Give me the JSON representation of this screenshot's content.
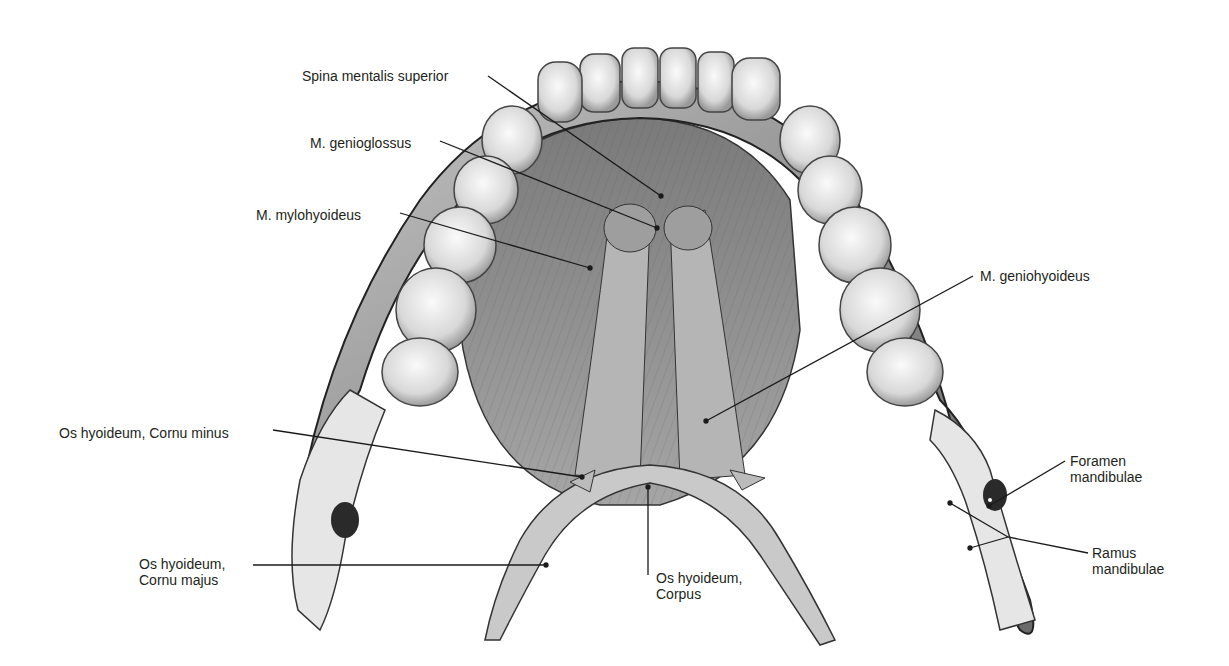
{
  "figure": {
    "colors": {
      "background": "#ffffff",
      "bone": "#d9d9d9",
      "bone_dark": "#8c8c8c",
      "tooth": "#eeeeee",
      "muscle": "#9a9a9a",
      "muscle_dark": "#5a5a5a",
      "label_text": "#231f20",
      "leader_line": "#1a1a1a"
    }
  },
  "labels": [
    {
      "id": "spina-mentalis-superior",
      "text": "Spina mentalis superior",
      "x": 302,
      "y": 68,
      "line": [
        [
          488,
          76
        ],
        [
          661,
          196
        ]
      ]
    },
    {
      "id": "m-genioglossus",
      "text": "M. genioglossus",
      "x": 310,
      "y": 135,
      "line": [
        [
          440,
          141
        ],
        [
          657,
          228
        ]
      ]
    },
    {
      "id": "m-mylohyoideus",
      "text": "M. mylohyoideus",
      "x": 256,
      "y": 207,
      "line": [
        [
          400,
          213
        ],
        [
          590,
          268
        ]
      ]
    },
    {
      "id": "m-geniohyoideus",
      "text": "M. geniohyoideus",
      "x": 980,
      "y": 268,
      "line": [
        [
          973,
          276
        ],
        [
          706,
          421
        ]
      ]
    },
    {
      "id": "os-hyoideum-cornu-minus",
      "text": "Os hyoideum, Cornu minus",
      "x": 59,
      "y": 425,
      "line": [
        [
          273,
          430
        ],
        [
          582,
          477
        ]
      ]
    },
    {
      "id": "foramen-mandibulae",
      "text": "Foramen\nmandibulae",
      "x": 1070,
      "y": 453,
      "line": [
        [
          1065,
          461
        ],
        [
          989,
          506
        ]
      ]
    },
    {
      "id": "ramus-mandibulae",
      "text": "Ramus\nmandibulae",
      "x": 1092,
      "y": 545,
      "line": [
        [
          1088,
          553
        ],
        [
          1008,
          537
        ],
        [
          950,
          503
        ]
      ],
      "line2": [
        [
          1008,
          537
        ],
        [
          970,
          548
        ]
      ]
    },
    {
      "id": "os-hyoideum-cornu-majus",
      "text": "Os hyoideum,\nCornu majus",
      "x": 139,
      "y": 556,
      "line": [
        [
          253,
          565
        ],
        [
          546,
          565
        ]
      ]
    },
    {
      "id": "os-hyoideum-corpus",
      "text": "Os hyoideum,\nCorpus",
      "x": 656,
      "y": 570,
      "line": [
        [
          648,
          575
        ],
        [
          648,
          487
        ]
      ]
    }
  ]
}
